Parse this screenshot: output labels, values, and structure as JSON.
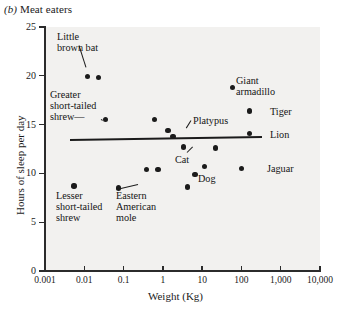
{
  "panel": {
    "letter": "(b)",
    "title": "Meat eaters"
  },
  "chart_data": {
    "type": "scatter",
    "title": "(b) Meat eaters",
    "xlabel": "Weight (Kg)",
    "ylabel": "Hours of sleep per day",
    "xscale": "log",
    "xlim": [
      0.001,
      10000
    ],
    "ylim": [
      0,
      25
    ],
    "grid": false,
    "legend": null,
    "xticks": [
      "0.001",
      "0.01",
      "0.1",
      "1",
      "10",
      "100",
      "1,000",
      "10,000"
    ],
    "xtick_values": [
      0.001,
      0.01,
      0.1,
      1,
      10,
      100,
      1000,
      10000
    ],
    "yticks": [
      "0",
      "5",
      "10",
      "15",
      "20",
      "25"
    ],
    "ytick_values": [
      0,
      5,
      10,
      15,
      20,
      25
    ],
    "points": [
      {
        "label": "Little brown bat",
        "weight": 0.012,
        "hours": 19.9
      },
      {
        "label": "",
        "weight": 0.023,
        "hours": 19.8
      },
      {
        "label": "Greater short-tailed shrew",
        "weight": 0.035,
        "hours": 15.5
      },
      {
        "label": "",
        "weight": 0.62,
        "hours": 15.5
      },
      {
        "label": "Platypus",
        "weight": 1.35,
        "hours": 14.4
      },
      {
        "label": "",
        "weight": 1.8,
        "hours": 13.8
      },
      {
        "label": "Giant armadillo",
        "weight": 60.0,
        "hours": 18.8
      },
      {
        "label": "Tiger",
        "weight": 162.0,
        "hours": 16.4
      },
      {
        "label": "Lion",
        "weight": 162.0,
        "hours": 14.1
      },
      {
        "label": "Cat",
        "weight": 3.3,
        "hours": 12.7
      },
      {
        "label": "",
        "weight": 22.0,
        "hours": 12.6
      },
      {
        "label": "",
        "weight": 0.38,
        "hours": 10.4
      },
      {
        "label": "",
        "weight": 0.75,
        "hours": 10.4
      },
      {
        "label": "Dog",
        "weight": 6.6,
        "hours": 9.9
      },
      {
        "label": "",
        "weight": 11.5,
        "hours": 10.7
      },
      {
        "label": "Jaguar",
        "weight": 100.0,
        "hours": 10.5
      },
      {
        "label": "",
        "weight": 4.2,
        "hours": 8.6
      },
      {
        "label": "Lesser short-tailed shrew",
        "weight": 0.0055,
        "hours": 8.7
      },
      {
        "label": "Eastern American mole",
        "weight": 0.075,
        "hours": 8.5
      }
    ],
    "trendline": {
      "x_start": 0.0043,
      "y_start": 13.5,
      "x_end": 330.0,
      "y_end": 13.8
    }
  },
  "annotations": [
    {
      "name": "little-brown-bat",
      "text": "Little\nbrown bat"
    },
    {
      "name": "greater-short-tailed-shrew",
      "text": "Greater\nshort-tailed\nshrew—"
    },
    {
      "name": "platypus",
      "text": "Platypus"
    },
    {
      "name": "giant-armadillo",
      "text": "Giant\narmadillo"
    },
    {
      "name": "tiger",
      "text": "Tiger"
    },
    {
      "name": "lion",
      "text": "Lion"
    },
    {
      "name": "cat",
      "text": "Cat"
    },
    {
      "name": "dog",
      "text": "Dog"
    },
    {
      "name": "jaguar",
      "text": "Jaguar"
    },
    {
      "name": "lesser-short-tailed-shrew",
      "text": "Lesser\nshort-tailed\nshrew"
    },
    {
      "name": "eastern-american-mole",
      "text": "Eastern\nAmerican\nmole"
    }
  ],
  "colors": {
    "point": "#1b1b1b",
    "axis": "#2b2b2b",
    "plot_bg": "#f2f1ef",
    "page_bg": "#ffffff"
  }
}
